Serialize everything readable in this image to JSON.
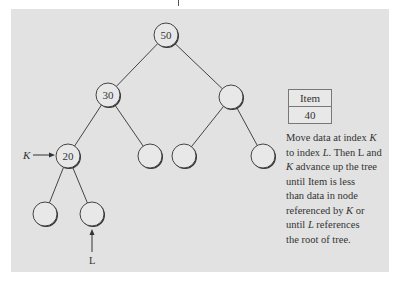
{
  "diagram": {
    "nodes": [
      {
        "id": "root",
        "label": "50",
        "x": 166,
        "y": 35
      },
      {
        "id": "left",
        "label": "30",
        "x": 108,
        "y": 95
      },
      {
        "id": "right",
        "label": "",
        "x": 231,
        "y": 97
      },
      {
        "id": "ll",
        "label": "20",
        "x": 68,
        "y": 156
      },
      {
        "id": "lr",
        "label": "",
        "x": 150,
        "y": 156
      },
      {
        "id": "rl",
        "label": "",
        "x": 184,
        "y": 156
      },
      {
        "id": "rr",
        "label": "",
        "x": 263,
        "y": 156
      },
      {
        "id": "lll",
        "label": "",
        "x": 45,
        "y": 214
      },
      {
        "id": "llr",
        "label": "",
        "x": 92,
        "y": 214
      }
    ],
    "pointers": {
      "k_label": "K",
      "l_label": "L"
    },
    "item_box": {
      "header": "Item",
      "value": "40"
    },
    "description": {
      "line1_pre": "Move data at index ",
      "line1_k": "K",
      "line2_pre": "to index ",
      "line2_l": "L",
      "line2_post": ". Then L and",
      "line3_k": "K",
      "line3_post": " advance up the tree",
      "line4": "until Item is less",
      "line5": "than data in node",
      "line6_pre": "referenced by ",
      "line6_k": "K",
      "line6_post": " or",
      "line7_pre": "until ",
      "line7_l": "L",
      "line7_post": " references",
      "line8": "the root of tree."
    }
  }
}
